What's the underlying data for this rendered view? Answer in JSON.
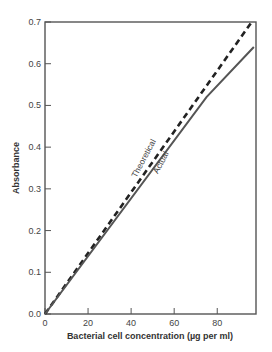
{
  "chart_data": {
    "type": "line",
    "title": "",
    "xlabel": "Bacterial cell concentration (µg per ml)",
    "ylabel": "Absorbance",
    "xlim": [
      0,
      98
    ],
    "ylim": [
      0,
      0.7
    ],
    "xticks": [
      0,
      20,
      40,
      60,
      80
    ],
    "xtick_labels": [
      "0",
      "20",
      "40",
      "60",
      "80"
    ],
    "yticks": [
      0.0,
      0.1,
      0.2,
      0.3,
      0.4,
      0.5,
      0.6,
      0.7
    ],
    "ytick_labels": [
      "0.0",
      "0.1",
      "0.2",
      "0.3",
      "0.4",
      "0.5",
      "0.6",
      "0.7"
    ],
    "grid": false,
    "legend": "none (inline annotations)",
    "series": [
      {
        "name": "Theoretical",
        "style": "dashed",
        "color": "#222222",
        "x": [
          0,
          96
        ],
        "y": [
          0.0,
          0.7
        ]
      },
      {
        "name": "Actual",
        "style": "solid",
        "color": "#555555",
        "x": [
          0,
          75,
          97
        ],
        "y": [
          0.0,
          0.52,
          0.64
        ]
      }
    ],
    "annotations": [
      {
        "text": "Theoretical",
        "x": 47,
        "y": 0.37,
        "rotation": -62
      },
      {
        "text": "Actual",
        "x": 55,
        "y": 0.36,
        "rotation": -62
      }
    ]
  }
}
